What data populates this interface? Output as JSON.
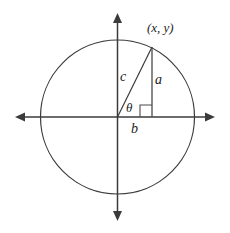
{
  "figure": {
    "kind": "unit-circle-right-triangle-diagram",
    "background_color": "#ffffff",
    "stroke_color": "#3b3b3b",
    "text_color": "#1d1d1d",
    "width": 230,
    "height": 233
  },
  "circle": {
    "center_x": 117.5,
    "center_y": 117,
    "radius": 77
  },
  "axes": {
    "horizontal": {
      "y": 117,
      "x_start": 15,
      "x_end": 215,
      "arrowheads": "both"
    },
    "vertical": {
      "x": 117.5,
      "y_start": 13,
      "y_end": 221,
      "arrowheads": "both"
    }
  },
  "triangle": {
    "origin_x": 117.5,
    "origin_y": 117,
    "point_x": 152,
    "point_y": 47,
    "right_angle_size": 12
  },
  "labels": {
    "point": "(x, y)",
    "hypotenuse": "c",
    "opposite": "a",
    "adjacent": "b",
    "angle": "θ"
  }
}
